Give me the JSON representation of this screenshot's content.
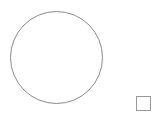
{
  "canvas": {
    "width": 156,
    "height": 120,
    "background": "#ffffff"
  },
  "shapes": [
    {
      "type": "circle",
      "stroke": "#8a8a8a",
      "fill": "none"
    },
    {
      "type": "square",
      "stroke": "#9a9a9a",
      "fill": "#ffffff"
    }
  ]
}
